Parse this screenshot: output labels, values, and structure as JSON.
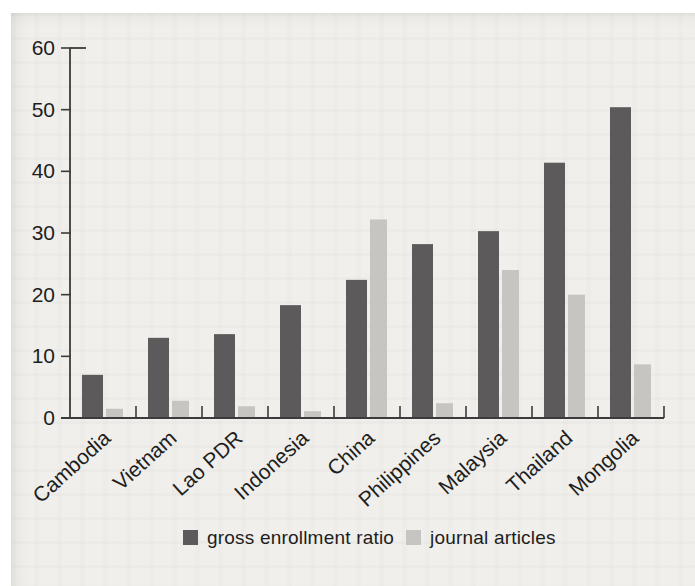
{
  "chart_data": {
    "type": "bar",
    "title": "",
    "xlabel": "",
    "ylabel": "",
    "categories": [
      "Cambodia",
      "Vietnam",
      "Lao PDR",
      "Indonesia",
      "China",
      "Philippines",
      "Malaysia",
      "Thailand",
      "Mongolia"
    ],
    "series": [
      {
        "name": "gross enrollment ratio",
        "color": "#5d5a5c",
        "values": [
          7,
          13,
          13.6,
          18.3,
          22.4,
          28.2,
          30.3,
          41.4,
          50.4
        ]
      },
      {
        "name": "journal articles",
        "color": "#c6c5c2",
        "values": [
          1.5,
          2.8,
          1.9,
          1.1,
          32.2,
          2.4,
          24,
          20,
          8.7
        ]
      }
    ],
    "ylim": [
      0,
      60
    ],
    "yticks": [
      0,
      10,
      20,
      30,
      40,
      50,
      60
    ],
    "grid": false,
    "legend_position": "bottom-center"
  },
  "colors": {
    "page_background": "#f0efeb",
    "scan_margin": "#ffffff",
    "axis": "#3b3b3b",
    "text": "#1e1e1e",
    "bar_dark": "#5d5a5c",
    "bar_light": "#c6c5c2"
  }
}
